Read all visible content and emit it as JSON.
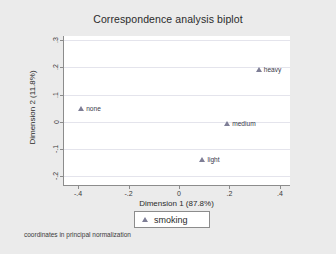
{
  "chart_data": {
    "type": "scatter",
    "title": "Correspondence analysis biplot",
    "xlabel": "Dimension 1 (87.8%)",
    "ylabel": "Dimension 2 (11.8%)",
    "xlim": [
      -0.46,
      0.44
    ],
    "ylim": [
      -0.235,
      0.315
    ],
    "xticks": [
      -0.4,
      -0.2,
      0,
      0.2,
      0.4
    ],
    "xticklabels": [
      "-.4",
      "-.2",
      "0",
      ".2",
      ".4"
    ],
    "yticks": [
      -0.2,
      -0.1,
      0,
      0.1,
      0.2,
      0.3
    ],
    "yticklabels": [
      "-.2",
      "-.1",
      "0",
      ".1",
      ".2",
      ".3"
    ],
    "grid": "horizontal",
    "legend_position": "below-axis",
    "marker": "triangle",
    "marker_color": "#7e7e96",
    "points": [
      {
        "label": "none",
        "x": -0.392,
        "y": 0.047
      },
      {
        "label": "heavy",
        "x": 0.312,
        "y": 0.191
      },
      {
        "label": "medium",
        "x": 0.187,
        "y": -0.006
      },
      {
        "label": "light",
        "x": 0.089,
        "y": -0.141
      }
    ],
    "series": [
      {
        "name": "smoking",
        "marker": "triangle",
        "color": "#7e7e96"
      }
    ],
    "annotations": [
      "coordinates in principal normalization"
    ]
  },
  "figure": {
    "background_color": "#ebebeb",
    "plot_background_color": "#ffffff",
    "axis_color": "#8c8c8c",
    "grid_color": "#e4e4ec"
  },
  "legend": {
    "items": [
      {
        "label": "smoking"
      }
    ]
  },
  "footnote": {
    "text": "coordinates in principal normalization"
  }
}
